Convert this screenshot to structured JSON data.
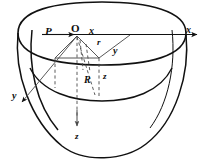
{
  "figure": {
    "stroke_color": "#111111",
    "dash_color": "#4a4a4a",
    "background": "#ffffff",
    "labels": {
      "point_P": "P",
      "origin_O": "O",
      "axis_x_origin": "x",
      "axis_x_arrow": "x",
      "radius_r": "r",
      "coord_y_radial": "y",
      "axis_y_arrow": "y",
      "radius_R": "R",
      "coord_z_mid": "z",
      "axis_z_arrow": "z"
    }
  }
}
